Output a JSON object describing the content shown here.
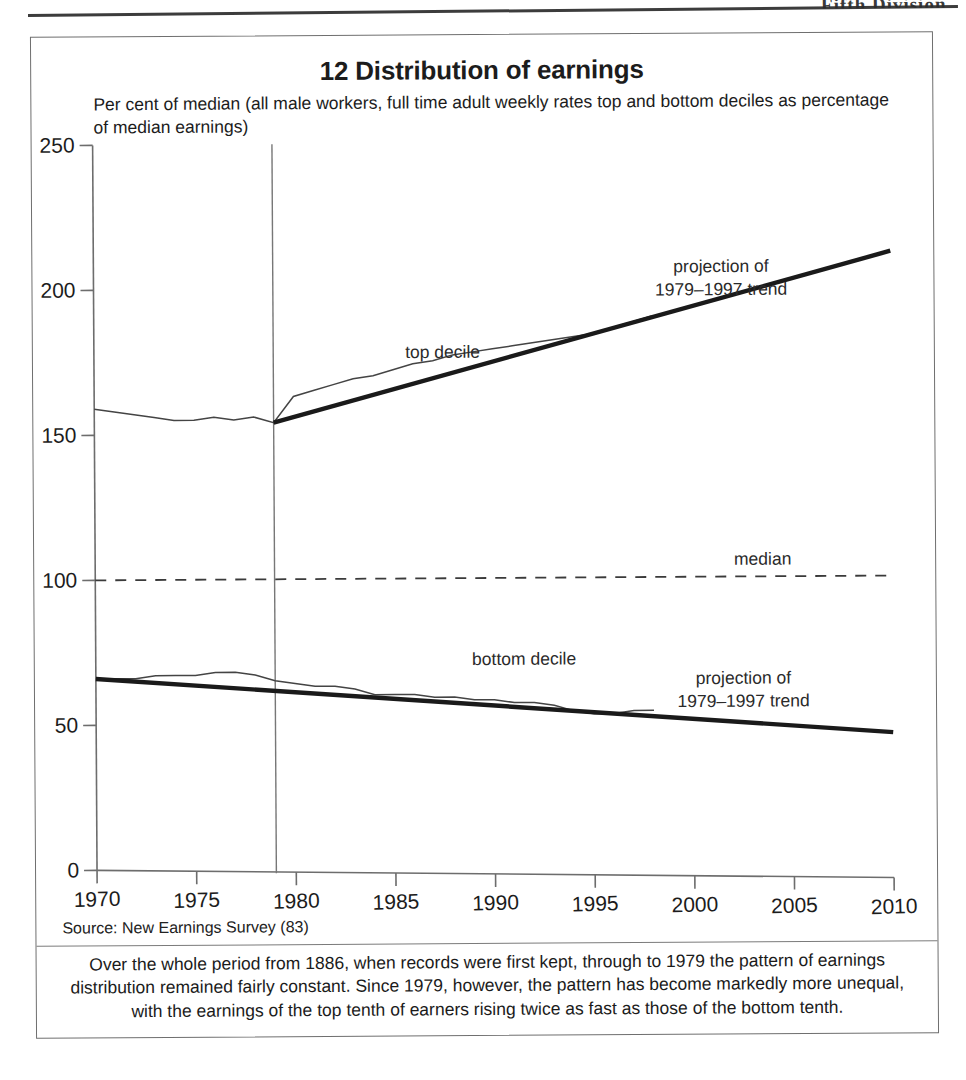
{
  "scan": {
    "header_fragment": "Fifth Division"
  },
  "figure": {
    "title": "12 Distribution of earnings",
    "subtitle": "Per cent of median (all male workers, full time adult weekly rates top and bottom deciles as percentage of median earnings)",
    "source": "Source: New Earnings Survey (83)",
    "caption": "Over the whole period from 1886, when records were first kept, through to 1979 the pattern of earnings distribution remained fairly constant. Since 1979, however, the pattern has become markedly more unequal, with the earnings of the top tenth of earners rising twice as fast as those of the bottom tenth."
  },
  "chart_data": {
    "type": "line",
    "title": "12 Distribution of earnings",
    "subtitle": "Per cent of median (all male workers, full time adult weekly rates top and bottom deciles as percentage of median earnings)",
    "xlabel": "",
    "ylabel": "Per cent of median",
    "xlim": [
      1970,
      2010
    ],
    "ylim": [
      0,
      250
    ],
    "xticks": [
      1970,
      1975,
      1980,
      1985,
      1990,
      1995,
      2000,
      2005,
      2010
    ],
    "yticks": [
      0,
      50,
      100,
      150,
      200,
      250
    ],
    "grid": false,
    "legend": "inline-annotations",
    "annotations": [
      {
        "text": "top decile",
        "x": 1987.5,
        "y": 176
      },
      {
        "text": "bottom decile",
        "x": 1991.5,
        "y": 70
      },
      {
        "text": "median",
        "x": 2003.5,
        "y": 104
      },
      {
        "text": "projection of\n1979–1997 trend",
        "x": 2001.5,
        "y": 205
      },
      {
        "text": "projection of\n1979–1997 trend",
        "x": 2002.5,
        "y": 63
      }
    ],
    "marker_line": {
      "label": "1979",
      "x": 1979
    },
    "series": [
      {
        "name": "top decile",
        "style": "thin-actual",
        "x": [
          1970,
          1971,
          1972,
          1973,
          1974,
          1975,
          1976,
          1977,
          1978,
          1979,
          1980,
          1981,
          1982,
          1983,
          1984,
          1985,
          1986,
          1987,
          1988,
          1989,
          1990,
          1991,
          1992,
          1993,
          1994,
          1995,
          1996,
          1997,
          1998
        ],
        "y": [
          159,
          158,
          157,
          156,
          155,
          155,
          156,
          155,
          156,
          154,
          163,
          165,
          167,
          169,
          170,
          172,
          174,
          175,
          177,
          178,
          179,
          180,
          181,
          182,
          183,
          184,
          186,
          188,
          190
        ]
      },
      {
        "name": "top decile projection of 1979–1997 trend",
        "style": "thick-trend",
        "x": [
          1979,
          2010
        ],
        "y": [
          154,
          212
        ]
      },
      {
        "name": "bottom decile",
        "style": "thin-actual",
        "x": [
          1970,
          1971,
          1972,
          1973,
          1974,
          1975,
          1976,
          1977,
          1978,
          1979,
          1980,
          1981,
          1982,
          1983,
          1984,
          1985,
          1986,
          1987,
          1988,
          1989,
          1990,
          1991,
          1992,
          1993,
          1994,
          1995,
          1996,
          1997,
          1998
        ],
        "y": [
          66,
          66,
          66,
          67,
          67,
          67,
          68,
          68,
          67,
          65,
          64,
          63,
          63,
          62,
          60,
          60,
          60,
          59,
          59,
          58,
          58,
          57,
          57,
          56,
          54,
          53,
          53,
          54,
          54
        ]
      },
      {
        "name": "bottom decile projection of 1979–1997 trend",
        "style": "thick-trend",
        "x": [
          1970,
          2010
        ],
        "y": [
          66,
          46
        ]
      },
      {
        "name": "median",
        "style": "dashed",
        "x": [
          1970,
          2010
        ],
        "y": [
          100,
          100
        ]
      }
    ]
  }
}
